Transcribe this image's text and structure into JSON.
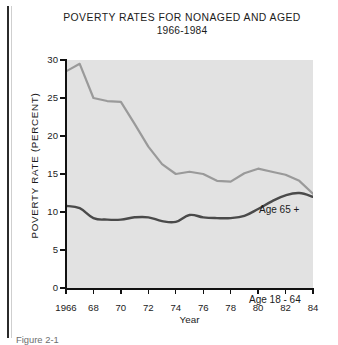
{
  "figure": {
    "title_line1": "POVERTY RATES FOR NONAGED AND  AGED",
    "title_line2": "1966-1984",
    "caption": "Figure 2-1"
  },
  "axes": {
    "ylabel": "POVERTY RATE (PERCENT)",
    "xlabel": "Year",
    "yticks": [
      "0",
      "5",
      "10",
      "15",
      "20",
      "25",
      "30"
    ],
    "xticks": [
      "1966",
      "68",
      "70",
      "72",
      "74",
      "76",
      "78",
      "80",
      "82",
      "84"
    ]
  },
  "annotations": {
    "aged": "Age 65 +",
    "nonaged": "Age 18 - 64"
  },
  "colors": {
    "plot_background": "#e2e2e2",
    "aged_line": "#9a9a9a",
    "nonaged_line": "#4a4a4a",
    "axis": "#111111",
    "text": "#1b1b1b",
    "page_background": "#ffffff"
  },
  "chart_data": {
    "type": "line",
    "title": "POVERTY RATES FOR NONAGED AND  AGED 1966-1984",
    "xlabel": "Year",
    "ylabel": "POVERTY RATE (PERCENT)",
    "xlim": [
      1966,
      1984
    ],
    "ylim": [
      0,
      30
    ],
    "ytick_step": 5,
    "xtick_step": 2,
    "grid": false,
    "legend": "in-plot annotations",
    "x": [
      1966,
      1967,
      1968,
      1969,
      1970,
      1971,
      1972,
      1973,
      1974,
      1975,
      1976,
      1977,
      1978,
      1979,
      1980,
      1981,
      1982,
      1983,
      1984
    ],
    "series": [
      {
        "name": "Age 65 +",
        "color": "#9a9a9a",
        "values": [
          28.5,
          29.5,
          25.0,
          24.6,
          24.5,
          21.6,
          18.6,
          16.3,
          15.0,
          15.3,
          15.0,
          14.1,
          14.0,
          15.1,
          15.7,
          15.3,
          14.9,
          14.1,
          12.4
        ]
      },
      {
        "name": "Age 18 - 64",
        "color": "#4a4a4a",
        "values": [
          10.8,
          10.5,
          9.2,
          9.0,
          9.0,
          9.3,
          9.3,
          8.8,
          8.7,
          9.6,
          9.3,
          9.2,
          9.2,
          9.5,
          10.4,
          11.4,
          12.2,
          12.5,
          12.0
        ]
      }
    ]
  }
}
